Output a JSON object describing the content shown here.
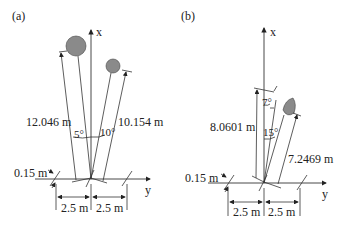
{
  "panels": [
    {
      "label": "(a)",
      "axis_x": "x",
      "axis_y": "y",
      "distances": [
        "12.046 m",
        "10.154 m"
      ],
      "angles": [
        "5°",
        "10°"
      ],
      "offset": "0.15 m",
      "spacing": [
        "2.5 m",
        "2.5 m"
      ]
    },
    {
      "label": "(b)",
      "axis_x": "x",
      "axis_y": "y",
      "distances": [
        "8.0601 m",
        "7.2469 m"
      ],
      "angles": [
        "7°",
        "15°"
      ],
      "offset": "0.15 m",
      "spacing": [
        "2.5 m",
        "2.5 m"
      ]
    }
  ],
  "colors": {
    "object_fill": "#8a8a8a",
    "line": "#333333"
  }
}
